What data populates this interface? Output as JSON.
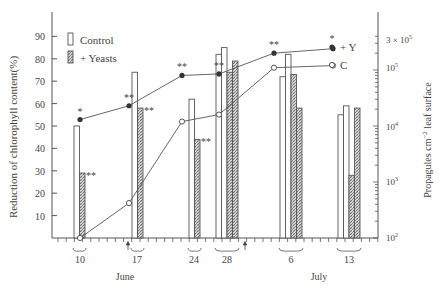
{
  "chart_data": {
    "type": "bar+line",
    "title": "",
    "xlabel_groups": [
      "June",
      "July"
    ],
    "categories": [
      "10",
      "17",
      "24",
      "28",
      "6",
      "13"
    ],
    "category_month": [
      "June",
      "June",
      "June",
      "June",
      "July",
      "July"
    ],
    "ylabel_left": "Reduction of chlorophyll content(%)",
    "ylabel_right": "Propagules cm⁻² leaf surface",
    "ylim_left": [
      0,
      95
    ],
    "yticks_left": [
      "10",
      "20",
      "30",
      "40",
      "50",
      "60",
      "70",
      "80",
      "90"
    ],
    "yticks_right": [
      "10²",
      "10³",
      "10⁴",
      "10⁵",
      "3 × 10⁵"
    ],
    "ylim_right_log": [
      100,
      400000
    ],
    "legend": {
      "bars": [
        {
          "name": "Control",
          "style": "open"
        },
        {
          "name": "+ Yeasts",
          "style": "hatched"
        }
      ],
      "lines": [
        {
          "name": "+ Y",
          "marker": "filled-circle"
        },
        {
          "name": "C",
          "marker": "open-circle"
        }
      ]
    },
    "bar_groups": [
      {
        "date": "10",
        "control": [
          50
        ],
        "yeasts": [
          29
        ],
        "yeasts_sig": "**",
        "control_sig": ""
      },
      {
        "date": "17",
        "control": [
          74
        ],
        "yeasts": [
          58
        ],
        "yeasts_sig": "**",
        "control_sig": ""
      },
      {
        "date": "24",
        "control": [
          62
        ],
        "yeasts": [
          44
        ],
        "yeasts_sig": "**",
        "control_sig": ""
      },
      {
        "date": "28",
        "control": [
          82,
          85
        ],
        "yeasts": [
          74,
          79
        ],
        "yeasts_sig": "",
        "control_sig": ""
      },
      {
        "date": "6",
        "control": [
          72,
          82
        ],
        "yeasts": [
          73,
          58
        ],
        "yeasts_sig": "",
        "control_sig": ""
      },
      {
        "date": "13",
        "control": [
          55,
          59
        ],
        "yeasts": [
          28,
          58
        ],
        "yeasts_sig": "",
        "control_sig": ""
      }
    ],
    "series": [
      {
        "name": "+ Y",
        "marker": "filled",
        "axis": "right",
        "values": [
          13000,
          23000,
          80000,
          85000,
          200000,
          240000
        ],
        "significance": [
          "*",
          "**",
          "**",
          "**",
          "**",
          "*"
        ]
      },
      {
        "name": "C",
        "marker": "open",
        "axis": "right",
        "values": [
          100,
          420,
          12000,
          16000,
          110000,
          120000
        ]
      }
    ],
    "annotations": [
      "arrow between 10 and 17 June",
      "arrow after 28 June"
    ],
    "grid": false
  },
  "axis": {
    "left_ticks": [
      {
        "label": "90",
        "value": 90
      },
      {
        "label": "80",
        "value": 80
      },
      {
        "label": "70",
        "value": 70
      },
      {
        "label": "60",
        "value": 60
      },
      {
        "label": "50",
        "value": 50
      },
      {
        "label": "40",
        "value": 40
      },
      {
        "label": "30",
        "value": 30
      },
      {
        "label": "20",
        "value": 20
      },
      {
        "label": "10",
        "value": 10
      }
    ],
    "right_ticks": [
      {
        "label": "3 × 10",
        "sup": "5",
        "y": 40
      },
      {
        "label": "10",
        "sup": "5",
        "y": 68
      },
      {
        "label": "10",
        "sup": "4",
        "y": 127
      },
      {
        "label": "10",
        "sup": "3",
        "y": 182
      },
      {
        "label": "10",
        "sup": "2",
        "y": 238
      }
    ],
    "left_label": "Reduction of chlorophyll content(%)",
    "right_label_a": "Propagules cm",
    "right_label_sup": "−2",
    "right_label_b": " leaf surface",
    "month_labels": [
      {
        "label": "June",
        "x": 125
      },
      {
        "label": "July",
        "x": 319
      }
    ],
    "date_labels": [
      {
        "label": "10",
        "x": 80
      },
      {
        "label": "17",
        "x": 137
      },
      {
        "label": "24",
        "x": 194
      },
      {
        "label": "28",
        "x": 227
      },
      {
        "label": "6",
        "x": 291
      },
      {
        "label": "13",
        "x": 349
      }
    ]
  },
  "legend": {
    "control_label": "Control",
    "yeasts_label": "+ Yeasts",
    "plus_y_label": "+ Y",
    "c_label": "C",
    "star_label": "*"
  }
}
